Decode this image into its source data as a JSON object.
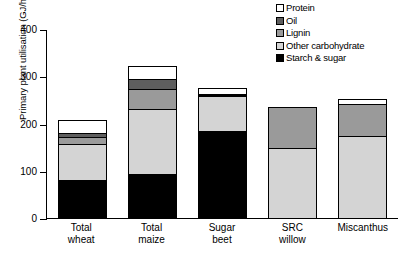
{
  "chart_data": {
    "type": "bar",
    "title": "",
    "xlabel": "",
    "ylabel": "Primary plant utilisation (GJ/ha)",
    "ylim": [
      0,
      400
    ],
    "yticks": [
      0,
      100,
      200,
      300,
      400
    ],
    "ytick_labels": [
      "0",
      "100",
      "200",
      "300",
      "400"
    ],
    "grid": false,
    "stacked": true,
    "legend_position": "top-right",
    "categories": [
      "Total wheat",
      "Total maize",
      "Sugar beet",
      "SRC willow",
      "Miscanthus"
    ],
    "category_lines": [
      [
        "Total",
        "wheat"
      ],
      [
        "Total",
        "maize"
      ],
      [
        "Sugar",
        "beet"
      ],
      [
        "SRC",
        "willow"
      ],
      [
        "Miscanthus",
        ""
      ]
    ],
    "series": [
      {
        "name": "Starch & sugar",
        "color": "#000000",
        "values": [
          80,
          93,
          184,
          0,
          0
        ]
      },
      {
        "name": "Other carbohydrate",
        "color": "#d4d4d4",
        "values": [
          76,
          138,
          74,
          148,
          173
        ]
      },
      {
        "name": "Lignin",
        "color": "#9a9a9a",
        "values": [
          15,
          42,
          3,
          85,
          68
        ]
      },
      {
        "name": "Oil",
        "color": "#5e5e5e",
        "values": [
          10,
          21,
          2,
          0,
          0
        ]
      },
      {
        "name": "Protein",
        "color": "#ffffff",
        "values": [
          25,
          26,
          9,
          0,
          8
        ]
      }
    ],
    "totals": [
      206,
      320,
      272,
      233,
      249
    ],
    "legend_order": [
      "Protein",
      "Oil",
      "Lignin",
      "Other carbohydrate",
      "Starch & sugar"
    ],
    "legend": [
      {
        "label": "Protein",
        "color": "#ffffff"
      },
      {
        "label": "Oil",
        "color": "#5e5e5e"
      },
      {
        "label": "Lignin",
        "color": "#9a9a9a"
      },
      {
        "label": "Other carbohydrate",
        "color": "#d4d4d4"
      },
      {
        "label": "Starch & sugar",
        "color": "#000000"
      }
    ]
  }
}
